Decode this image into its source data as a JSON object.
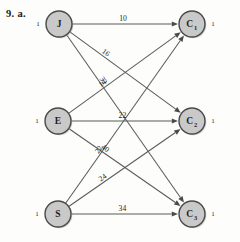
{
  "figure": {
    "caption": "9. a.",
    "type": "bipartite-transportation-network"
  },
  "supply_nodes": [
    {
      "id": "J",
      "label": "J",
      "sub": "",
      "supply": "1",
      "cx": 59,
      "cy": 24
    },
    {
      "id": "E",
      "label": "E",
      "sub": "",
      "supply": "1",
      "cx": 58,
      "cy": 121
    },
    {
      "id": "S",
      "label": "S",
      "sub": "",
      "supply": "1",
      "cx": 58,
      "cy": 214
    }
  ],
  "demand_nodes": [
    {
      "id": "C1",
      "label": "C",
      "sub": "1",
      "demand": "1",
      "cx": 192,
      "cy": 24
    },
    {
      "id": "C2",
      "label": "C",
      "sub": "2",
      "demand": "1",
      "cx": 192,
      "cy": 121
    },
    {
      "id": "C3",
      "label": "C",
      "sub": "3",
      "demand": "1",
      "cx": 192,
      "cy": 214
    }
  ],
  "edges": [
    {
      "from": "J",
      "to": "C1",
      "cost": "10"
    },
    {
      "from": "J",
      "to": "C2",
      "cost": "16"
    },
    {
      "from": "J",
      "to": "C3",
      "cost": "32"
    },
    {
      "from": "E",
      "to": "C1",
      "cost": "14"
    },
    {
      "from": "E",
      "to": "C2",
      "cost": "22"
    },
    {
      "from": "E",
      "to": "C3",
      "cost": "40"
    },
    {
      "from": "S",
      "to": "C1",
      "cost": "22"
    },
    {
      "from": "S",
      "to": "C2",
      "cost": "24"
    },
    {
      "from": "S",
      "to": "C3",
      "cost": "34"
    }
  ],
  "chart_data": {
    "type": "diagram",
    "title": "9. a.",
    "left_nodes": [
      "J",
      "E",
      "S"
    ],
    "right_nodes": [
      "C1",
      "C2",
      "C3"
    ],
    "supplies": [
      1,
      1,
      1
    ],
    "demands": [
      1,
      1,
      1
    ],
    "cost_matrix": [
      [
        10,
        16,
        32
      ],
      [
        14,
        22,
        40
      ],
      [
        22,
        24,
        34
      ]
    ]
  },
  "colors": {
    "node_fill": "#c9c9c9",
    "node_stroke": "#4a4a4a",
    "edge": "#5b5b5b",
    "text": "#1d1d1d",
    "background": "#fdfdfb"
  }
}
